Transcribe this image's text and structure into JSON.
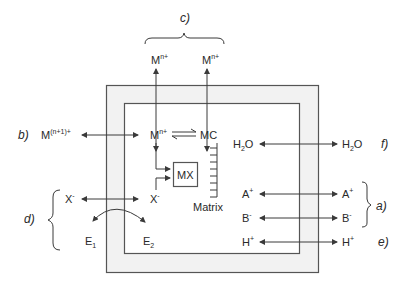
{
  "diagram": {
    "type": "schematic",
    "colors": {
      "background": "#ffffff",
      "wall_fill": "#f2f2f2",
      "line": "#3a3a3a",
      "text": "#2a2a2a"
    },
    "tags": {
      "a": "a)",
      "b": "b)",
      "c": "c)",
      "d": "d)",
      "e": "e)",
      "f": "f)"
    },
    "species": {
      "c_left_outer": {
        "base": "M",
        "sup": "n+"
      },
      "c_right_outer": {
        "base": "M",
        "sup": "n+"
      },
      "b_outer": {
        "base": "M",
        "sup": "(n+1)+"
      },
      "m_inner": {
        "base": "M",
        "sup": "n+"
      },
      "mc_inner": {
        "base": "MC"
      },
      "mx_box": {
        "base": "MX"
      },
      "matrix_label": {
        "base": "Matrix"
      },
      "x_inner": {
        "base": "X",
        "sup": "-"
      },
      "x_outer": {
        "base": "X",
        "sup": "-"
      },
      "e1": {
        "base": "E",
        "sub": "1"
      },
      "e2": {
        "base": "E",
        "sub": "2"
      },
      "h2o_inner": {
        "base": "H",
        "sub": "2",
        "tail": "O"
      },
      "h2o_outer": {
        "base": "H",
        "sub": "2",
        "tail": "O"
      },
      "a_inner": {
        "base": "A",
        "sup": "+"
      },
      "a_outer": {
        "base": "A",
        "sup": "+"
      },
      "b_inner": {
        "base": "B",
        "sup": "-"
      },
      "b_outer_ion": {
        "base": "B",
        "sup": "-"
      },
      "h_inner": {
        "base": "H",
        "sup": "+"
      },
      "h_outer": {
        "base": "H",
        "sup": "+"
      }
    }
  }
}
